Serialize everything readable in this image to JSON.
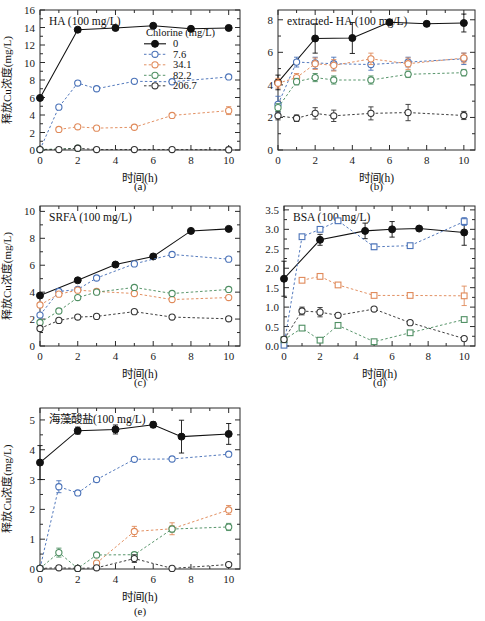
{
  "figure": {
    "caption_a": "(a)",
    "caption_b": "(b)",
    "caption_c": "(c)",
    "caption_d": "(d)",
    "caption_e": "(e)",
    "xlabel": "时间(h)",
    "ylabel": "释放Cu浓度(mg/L)"
  },
  "legend": {
    "title": "Chlorine (mg/L)",
    "entries": [
      {
        "label": "0",
        "color": "#111111",
        "marker": "filled-circle",
        "line": "solid"
      },
      {
        "label": "7.6",
        "color": "#4a72b8",
        "marker": "open-circle",
        "line": "dashed"
      },
      {
        "label": "34.1",
        "color": "#e08a5a",
        "marker": "open-circle",
        "line": "dashed"
      },
      {
        "label": "82.2",
        "color": "#4f8f63",
        "marker": "open-circle",
        "line": "dashed"
      },
      {
        "label": "206.7",
        "color": "#333333",
        "marker": "open-circle",
        "line": "dashed"
      }
    ]
  },
  "chart_data": [
    {
      "id": "a",
      "type": "line",
      "title": "HA (100 mg/L)",
      "xlabel": "时间(h)",
      "ylabel": "释放Cu浓度(mg/L)",
      "xlim": [
        0,
        10.6
      ],
      "ylim": [
        0,
        16
      ],
      "xticks": [
        0,
        2,
        4,
        6,
        8,
        10
      ],
      "yticks": [
        0,
        2,
        4,
        6,
        8,
        10,
        12,
        14,
        16
      ],
      "grid": false,
      "legend_position": "inside-upper-right",
      "series": [
        {
          "name": "0",
          "color": "#111111",
          "marker": "filled-circle",
          "line": "solid",
          "x": [
            0,
            2,
            4,
            6,
            8,
            10
          ],
          "y": [
            5.95,
            13.75,
            13.95,
            14.2,
            13.85,
            13.95
          ],
          "err": [
            0,
            0.25,
            0.2,
            0.25,
            0.2,
            0.25
          ]
        },
        {
          "name": "7.6",
          "color": "#4a72b8",
          "marker": "open-circle",
          "line": "dashed",
          "x": [
            0,
            1,
            2,
            3,
            5,
            7,
            10
          ],
          "y": [
            0.05,
            4.9,
            7.65,
            7.0,
            7.85,
            7.8,
            8.35
          ],
          "err": [
            0,
            0,
            0.25,
            0.2,
            0.15,
            0.15,
            0.2
          ]
        },
        {
          "name": "34.1",
          "color": "#e08a5a",
          "marker": "open-circle",
          "line": "dashed",
          "x": [
            1,
            2,
            3,
            5,
            7,
            10
          ],
          "y": [
            2.35,
            2.65,
            2.5,
            2.6,
            3.95,
            4.5
          ],
          "err": [
            0.1,
            0.1,
            0.15,
            0.1,
            0.1,
            0.45
          ]
        },
        {
          "name": "82.2",
          "color": "#4f8f63",
          "marker": "open-circle",
          "line": "dashed",
          "x": [
            0,
            2
          ],
          "y": [
            0.05,
            0.2
          ],
          "err": [
            0,
            0.2
          ]
        },
        {
          "name": "206.7",
          "color": "#333333",
          "marker": "open-circle",
          "line": "dashed",
          "x": [
            0,
            1,
            2,
            3,
            5,
            7,
            10
          ],
          "y": [
            0.05,
            0.05,
            0.2,
            0.05,
            0.05,
            0.05,
            0.03
          ],
          "err": [
            0,
            0,
            0.2,
            0,
            0,
            0,
            0
          ]
        }
      ]
    },
    {
      "id": "b",
      "type": "line",
      "title": "extracted- HA (100 mg/L)",
      "xlabel": "时间(h)",
      "ylabel": "",
      "xlim": [
        0,
        10.6
      ],
      "ylim": [
        0,
        8.6
      ],
      "xticks": [
        0,
        2,
        4,
        6,
        8,
        10
      ],
      "yticks": [
        0,
        2,
        4,
        6,
        8
      ],
      "grid": false,
      "legend_position": "none",
      "series": [
        {
          "name": "0",
          "color": "#111111",
          "marker": "filled-circle",
          "line": "solid",
          "x": [
            0,
            2,
            4,
            6,
            8,
            10
          ],
          "y": [
            4.15,
            6.85,
            6.88,
            7.85,
            7.75,
            7.8
          ],
          "err": [
            0.45,
            0.9,
            0.95,
            0.15,
            0.15,
            0.55
          ]
        },
        {
          "name": "7.6",
          "color": "#4a72b8",
          "marker": "open-circle",
          "line": "dashed",
          "x": [
            0,
            1,
            2,
            3,
            5,
            7,
            10
          ],
          "y": [
            2.8,
            5.4,
            5.35,
            5.3,
            5.25,
            5.4,
            5.6
          ],
          "err": [
            0.5,
            0.3,
            0.35,
            0.4,
            0.35,
            0.3,
            0.35
          ]
        },
        {
          "name": "34.1",
          "color": "#e08a5a",
          "marker": "open-circle",
          "line": "dashed",
          "x": [
            0,
            1,
            2,
            3,
            5,
            7,
            10
          ],
          "y": [
            4.1,
            4.45,
            5.3,
            5.2,
            5.6,
            5.3,
            5.65
          ],
          "err": [
            0.3,
            0.25,
            0.35,
            0.35,
            0.35,
            0.35,
            0.3
          ]
        },
        {
          "name": "82.2",
          "color": "#4f8f63",
          "marker": "open-circle",
          "line": "dashed",
          "x": [
            0,
            1,
            2,
            3,
            5,
            7,
            10
          ],
          "y": [
            2.6,
            4.2,
            4.45,
            4.3,
            4.3,
            4.65,
            4.75
          ],
          "err": [
            0.25,
            0.2,
            0.25,
            0.25,
            0.25,
            0.2,
            0.2
          ]
        },
        {
          "name": "206.7",
          "color": "#333333",
          "marker": "open-circle",
          "line": "dashed",
          "x": [
            0,
            1,
            2,
            3,
            5,
            7,
            10
          ],
          "y": [
            2.1,
            1.95,
            2.25,
            2.1,
            2.25,
            2.3,
            2.12
          ],
          "err": [
            0.25,
            0.2,
            0.35,
            0.35,
            0.4,
            0.5,
            0.25
          ]
        }
      ]
    },
    {
      "id": "c",
      "type": "line",
      "title": "SRFA (100 mg/L)",
      "xlabel": "时间(h)",
      "ylabel": "释放Cu浓度(mg/L)",
      "xlim": [
        0,
        10.6
      ],
      "ylim": [
        0,
        10.4
      ],
      "xticks": [
        0,
        2,
        4,
        6,
        8,
        10
      ],
      "yticks": [
        0,
        2,
        4,
        6,
        8,
        10
      ],
      "grid": false,
      "legend_position": "none",
      "series": [
        {
          "name": "0",
          "color": "#111111",
          "marker": "filled-circle",
          "line": "solid",
          "x": [
            0,
            2,
            4,
            6,
            8,
            10
          ],
          "y": [
            3.75,
            4.88,
            6.05,
            6.65,
            8.55,
            8.7
          ],
          "err": [
            0.1,
            0.1,
            0.1,
            0.1,
            0.1,
            0.1
          ]
        },
        {
          "name": "7.6",
          "color": "#4a72b8",
          "marker": "open-circle",
          "line": "dashed",
          "x": [
            0,
            1,
            2,
            3,
            5,
            7,
            10
          ],
          "y": [
            2.3,
            4.05,
            4.2,
            5.05,
            6.1,
            6.8,
            6.45
          ],
          "err": [
            0.1,
            0.1,
            0.1,
            0.1,
            0.1,
            0.1,
            0.1
          ]
        },
        {
          "name": "34.1",
          "color": "#e08a5a",
          "marker": "open-circle",
          "line": "dashed",
          "x": [
            0,
            1,
            2,
            3,
            5,
            7,
            10
          ],
          "y": [
            3.05,
            3.85,
            4.15,
            4.05,
            3.9,
            3.45,
            3.6
          ],
          "err": [
            0.1,
            0.1,
            0.1,
            0.1,
            0.1,
            0.1,
            0.1
          ]
        },
        {
          "name": "82.2",
          "color": "#4f8f63",
          "marker": "open-circle",
          "line": "dashed",
          "x": [
            0,
            1,
            2,
            3,
            5,
            7,
            10
          ],
          "y": [
            1.75,
            2.6,
            3.6,
            4.0,
            4.35,
            3.9,
            4.2
          ],
          "err": [
            0.1,
            0.1,
            0.1,
            0.1,
            0.1,
            0.1,
            0.1
          ]
        },
        {
          "name": "206.7",
          "color": "#333333",
          "marker": "open-circle",
          "line": "dashed",
          "x": [
            0,
            1,
            2,
            3,
            5,
            7,
            10
          ],
          "y": [
            1.3,
            1.9,
            2.15,
            2.2,
            2.55,
            2.15,
            2.02
          ],
          "err": [
            0.1,
            0.1,
            0.1,
            0.1,
            0.1,
            0.1,
            0.1
          ]
        }
      ]
    },
    {
      "id": "d",
      "type": "line",
      "title": "BSA (100 mg/L)",
      "xlabel": "时间(h)",
      "ylabel": "",
      "xlim": [
        0,
        10.6
      ],
      "ylim": [
        0,
        3.6
      ],
      "xticks": [
        0,
        2,
        4,
        6,
        8,
        10
      ],
      "yticks": [
        0.0,
        0.5,
        1.0,
        1.5,
        2.0,
        2.5,
        3.0,
        3.5
      ],
      "ytick_labels": [
        "0.0",
        "0.5",
        "1.0",
        "1.5",
        "2.0",
        "2.5",
        "3.0",
        "3.5"
      ],
      "grid": false,
      "legend_position": "none",
      "series": [
        {
          "name": "0",
          "color": "#111111",
          "marker": "filled-circle",
          "line": "solid",
          "x": [
            0,
            2,
            4.5,
            6,
            7.5,
            10
          ],
          "y": [
            1.73,
            2.73,
            2.96,
            3.0,
            3.02,
            2.92
          ],
          "err": [
            0.45,
            0.14,
            0.2,
            0.2,
            0.05,
            0.33
          ]
        },
        {
          "name": "7.6",
          "color": "#4a72b8",
          "marker": "open-square",
          "line": "dashed",
          "x": [
            0,
            1,
            2,
            3,
            5,
            7,
            10
          ],
          "y": [
            0.02,
            2.81,
            3.0,
            3.22,
            2.55,
            2.58,
            3.2
          ],
          "err": [
            0,
            0,
            0,
            0,
            0.07,
            0,
            0.1
          ]
        },
        {
          "name": "34.1",
          "color": "#e08a5a",
          "marker": "open-square",
          "line": "dashed",
          "x": [
            1,
            2,
            3,
            5,
            7,
            10
          ],
          "y": [
            1.69,
            1.79,
            1.57,
            1.3,
            1.3,
            1.29
          ],
          "err": [
            0,
            0.06,
            0,
            0,
            0,
            0.25
          ]
        },
        {
          "name": "82.2",
          "color": "#4f8f63",
          "marker": "open-square",
          "line": "dashed",
          "x": [
            0,
            1,
            2,
            3,
            5,
            7,
            10
          ],
          "y": [
            0.16,
            0.46,
            0.15,
            0.53,
            0.11,
            0.34,
            0.68
          ],
          "err": [
            0,
            0,
            0,
            0,
            0,
            0,
            0
          ]
        },
        {
          "name": "206.7",
          "color": "#333333",
          "marker": "open-circle",
          "line": "dashed",
          "x": [
            0,
            1,
            2,
            3,
            5,
            7,
            10
          ],
          "y": [
            0.17,
            0.9,
            0.87,
            0.79,
            0.95,
            0.6,
            0.19
          ],
          "err": [
            0,
            0.1,
            0.12,
            0,
            0,
            0,
            0
          ]
        }
      ]
    },
    {
      "id": "e",
      "type": "line",
      "title": "海藻酸盐(100 mg/L)",
      "xlabel": "时间(h)",
      "ylabel": "释放Cu浓度(mg/L)",
      "xlim": [
        0,
        10.6
      ],
      "ylim": [
        0,
        5.4
      ],
      "xticks": [
        0,
        2,
        4,
        6,
        8,
        10
      ],
      "yticks": [
        0,
        1,
        2,
        3,
        4,
        5
      ],
      "grid": false,
      "legend_position": "none",
      "series": [
        {
          "name": "0",
          "color": "#111111",
          "marker": "filled-circle",
          "line": "solid",
          "x": [
            0,
            2,
            4,
            6,
            7.5,
            10
          ],
          "y": [
            3.57,
            4.64,
            4.68,
            4.84,
            4.44,
            4.53
          ],
          "err": [
            0.57,
            0.12,
            0.15,
            0.1,
            0.55,
            0.35
          ]
        },
        {
          "name": "7.6",
          "color": "#4a72b8",
          "marker": "open-circle",
          "line": "dashed",
          "x": [
            0,
            1,
            2,
            3,
            5,
            7,
            10
          ],
          "y": [
            0.02,
            2.76,
            2.55,
            3.0,
            3.68,
            3.69,
            3.85
          ],
          "err": [
            0,
            0.2,
            0.08,
            0.05,
            0.05,
            0.05,
            0.05
          ]
        },
        {
          "name": "34.1",
          "color": "#e08a5a",
          "marker": "open-circle",
          "line": "dashed",
          "x": [
            3,
            5,
            7,
            10
          ],
          "y": [
            0.2,
            1.26,
            1.35,
            1.98
          ],
          "err": [
            0,
            0.17,
            0.2,
            0.15
          ]
        },
        {
          "name": "82.2",
          "color": "#4f8f63",
          "marker": "open-circle",
          "line": "dashed",
          "x": [
            0,
            1,
            2,
            3,
            5,
            7,
            10
          ],
          "y": [
            0.02,
            0.55,
            0.02,
            0.47,
            0.48,
            1.34,
            1.41
          ],
          "err": [
            0,
            0.15,
            0,
            0,
            0,
            0.1,
            0.12
          ]
        },
        {
          "name": "206.7",
          "color": "#333333",
          "marker": "open-circle",
          "line": "dashed",
          "x": [
            0,
            1,
            2,
            3,
            5,
            7,
            10
          ],
          "y": [
            0.02,
            0.04,
            0.02,
            0.04,
            0.35,
            0.02,
            0.15
          ],
          "err": [
            0,
            0,
            0,
            0,
            0.13,
            0,
            0
          ]
        }
      ]
    }
  ]
}
